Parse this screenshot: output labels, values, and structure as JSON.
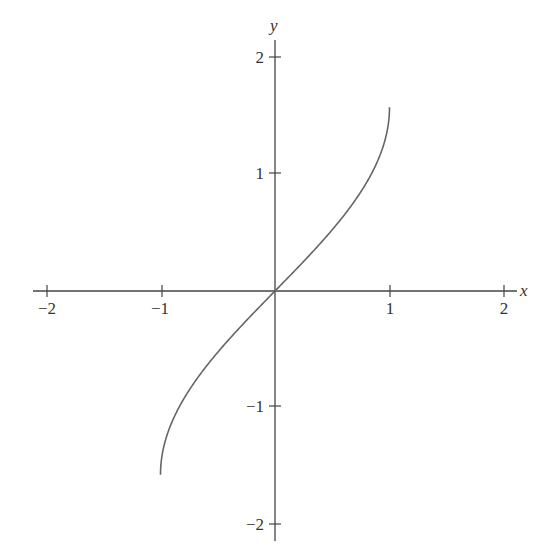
{
  "chart_data": {
    "type": "line",
    "title": "",
    "function": "y = arcsin(x)",
    "xlabel": "x",
    "ylabel": "y",
    "xlim": [
      -2,
      2
    ],
    "ylim": [
      -2,
      2
    ],
    "grid": false,
    "legend": null,
    "x_ticks": [
      "−2",
      "−1",
      "1",
      "2"
    ],
    "y_ticks": [
      "2",
      "1",
      "−1",
      "−2"
    ],
    "series": [
      {
        "name": "arcsin(x)",
        "color": "#666666",
        "x": [
          -1,
          -0.98,
          -0.9,
          -0.75,
          -0.5,
          -0.25,
          0,
          0.25,
          0.5,
          0.75,
          0.9,
          0.98,
          1
        ],
        "values": [
          -1.571,
          -1.37,
          -1.12,
          -0.848,
          -0.524,
          -0.253,
          0,
          0.253,
          0.524,
          0.848,
          1.12,
          1.37,
          1.571
        ]
      }
    ]
  }
}
